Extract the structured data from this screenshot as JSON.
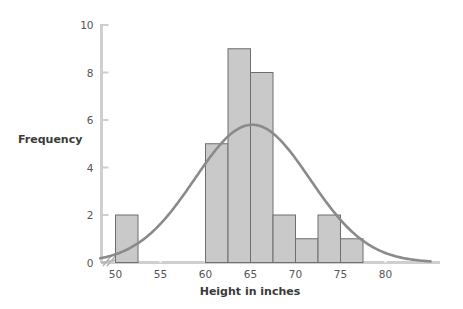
{
  "chart_data": {
    "type": "bar",
    "title": "",
    "subtitle": "",
    "xlabel": "Height in inches",
    "ylabel": "Frequency",
    "xlim": [
      48,
      85
    ],
    "ylim": [
      0,
      10
    ],
    "grid": false,
    "legend": null,
    "axis_break": true,
    "x_ticks": [
      50,
      55,
      60,
      65,
      70,
      75,
      80
    ],
    "x_tick_labels": [
      "50",
      "55",
      "60",
      "65",
      "70",
      "75",
      "80"
    ],
    "y_ticks": [
      0,
      2,
      4,
      6,
      8,
      10
    ],
    "y_tick_labels": [
      "0",
      "2",
      "4",
      "6",
      "8",
      "10"
    ],
    "bin_width": 2.5,
    "bins": [
      {
        "left": 50.0,
        "right": 52.5,
        "value": 2
      },
      {
        "left": 60.0,
        "right": 62.5,
        "value": 5
      },
      {
        "left": 62.5,
        "right": 65.0,
        "value": 9
      },
      {
        "left": 65.0,
        "right": 67.5,
        "value": 8
      },
      {
        "left": 67.5,
        "right": 70.0,
        "value": 2
      },
      {
        "left": 70.0,
        "right": 72.5,
        "value": 1
      },
      {
        "left": 72.5,
        "right": 75.0,
        "value": 2
      },
      {
        "left": 75.0,
        "right": 77.5,
        "value": 1
      }
    ],
    "categories": [
      "50-52.5",
      "60-62.5",
      "62.5-65",
      "65-67.5",
      "67.5-70",
      "70-72.5",
      "72.5-75",
      "75-77.5"
    ],
    "values": [
      2,
      5,
      9,
      8,
      2,
      1,
      2,
      1
    ],
    "overlay_curve": {
      "name": "normal-curve",
      "type": "line",
      "mean": 65.2,
      "peak_value": 5.8,
      "std_dev": 6.4,
      "x_start": 48.3,
      "x_end": 85.0
    },
    "colors": {
      "bar_fill": "#c9c9c9",
      "bar_stroke": "#6e6e6e",
      "curve": "#8a8a8a",
      "axis": "#cfcfcf",
      "tick_text": "#555555",
      "label_text": "#3a3a3a",
      "background": "#ffffff"
    }
  }
}
